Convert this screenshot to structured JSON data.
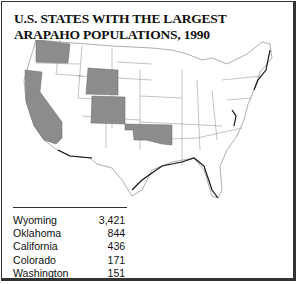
{
  "title": "U.S. STATES WITH THE LARGEST ARAPAHO POPULATIONS, 1990",
  "colors": {
    "highlight": "#8c8c8c",
    "border": "#333333",
    "background": "#ffffff"
  },
  "highlighted_states": [
    "Washington",
    "California",
    "Wyoming",
    "Colorado",
    "Oklahoma"
  ],
  "table": [
    {
      "state": "Wyoming",
      "value": "3,421"
    },
    {
      "state": "Oklahoma",
      "value": "844"
    },
    {
      "state": "California",
      "value": "436"
    },
    {
      "state": "Colorado",
      "value": "171"
    },
    {
      "state": "Washington",
      "value": "151"
    }
  ]
}
